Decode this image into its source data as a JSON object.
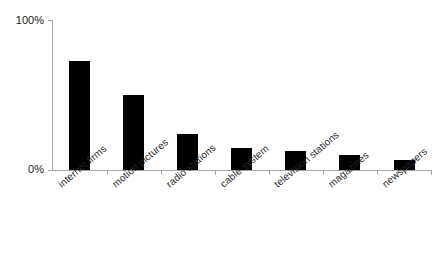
{
  "chart_data": {
    "type": "bar",
    "title": "",
    "subtitle": "",
    "xlabel": "",
    "ylabel": "",
    "ylim": [
      0,
      100
    ],
    "yticks": [
      "0%",
      "100%"
    ],
    "ytick_values": [
      0,
      100
    ],
    "grid": false,
    "legend": null,
    "orientation": "vertical",
    "bar_color": "#000000",
    "axis_color": "#a6a6a6",
    "categories": [
      "internet firms",
      "motion pictures",
      "radio stations",
      "cable system",
      "television stations",
      "magazines",
      "newspapers"
    ],
    "values": [
      73,
      50,
      24,
      15,
      13,
      10,
      7
    ],
    "units": "percent"
  },
  "axis": {
    "y_top_label": "100%",
    "y_bottom_label": "0%"
  }
}
